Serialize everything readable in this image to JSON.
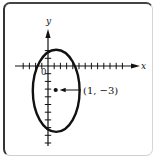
{
  "figure": {
    "type": "ellipse-graph",
    "axes": {
      "x_label": "x",
      "y_label": "y",
      "origin_label": "0",
      "x_ticks": {
        "from": -5,
        "to": 14
      },
      "y_ticks": {
        "from": 2,
        "to": -8
      }
    },
    "ellipse": {
      "center": [
        1,
        -3
      ],
      "semi_axis_x": 3,
      "semi_axis_y": 5.3
    },
    "point": {
      "coords": [
        1,
        -3
      ],
      "label": "(1, −3)"
    },
    "colors": {
      "ink": "#111111",
      "frame": "#333333",
      "background": "#ffffff"
    }
  }
}
